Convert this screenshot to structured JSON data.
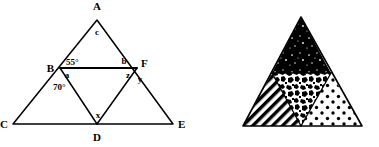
{
  "figure": {
    "background_color": "#ffffff",
    "line_color": "#000000",
    "panels": [
      {
        "name": "labeled-geometry-triangle",
        "description": "Triangle with cevians and labeled angles"
      },
      {
        "name": "patterned-triangle",
        "description": "Triangle subdivided into four smaller triangles with distinct fill patterns"
      }
    ]
  },
  "left_diagram": {
    "vertices": {
      "A": "A",
      "B": "B",
      "C": "C",
      "D": "D",
      "E": "E",
      "F": "F"
    },
    "angles": {
      "angle_55": "55°",
      "angle_70": "70°"
    },
    "variables": {
      "a": "a",
      "b": "b",
      "c": "c",
      "x": "x",
      "y": "y",
      "z": "z"
    }
  },
  "right_diagram": {
    "regions": [
      {
        "name": "top-triangle",
        "pattern": "black-with-white-speckles"
      },
      {
        "name": "left-triangle",
        "pattern": "diagonal-stripes"
      },
      {
        "name": "center-inverted-triangle",
        "pattern": "mottled-noise"
      },
      {
        "name": "right-triangle",
        "pattern": "black-dots-on-white"
      }
    ]
  }
}
